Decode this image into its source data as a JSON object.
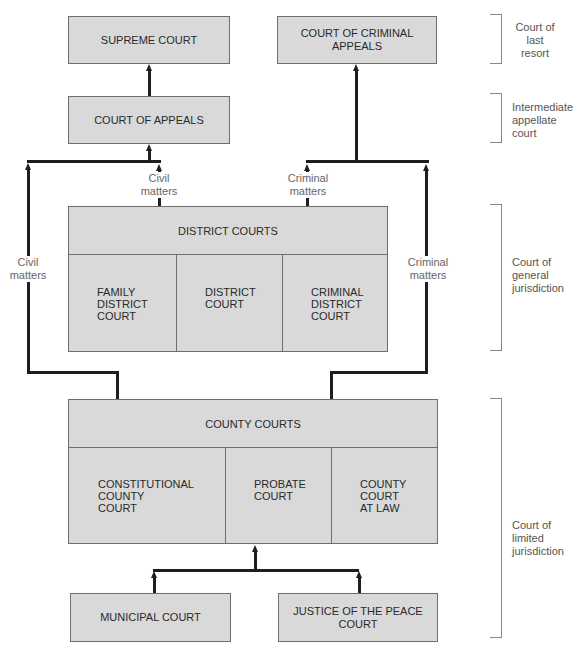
{
  "diagram": {
    "courts": {
      "supreme_court": "SUPREME COURT",
      "court_of_criminal_appeals": [
        "COURT OF CRIMINAL",
        "APPEALS"
      ],
      "court_of_appeals": "COURT OF APPEALS",
      "district_courts": {
        "header": "DISTRICT COURTS",
        "cells": [
          [
            "FAMILY",
            "DISTRICT",
            "COURT"
          ],
          [
            "DISTRICT",
            "COURT"
          ],
          [
            "CRIMINAL",
            "DISTRICT",
            "COURT"
          ]
        ]
      },
      "county_courts": {
        "header": "COUNTY COURTS",
        "cells": [
          [
            "CONSTITUTIONAL",
            "COUNTY",
            "COURT"
          ],
          [
            "PROBATE",
            "COURT"
          ],
          [
            "COUNTY",
            "COURT",
            "AT LAW"
          ]
        ]
      },
      "municipal_court": "MUNICIPAL COURT",
      "justice_of_the_peace_court": [
        "JUSTICE OF THE PEACE",
        "COURT"
      ]
    },
    "flow_labels": {
      "civil_left": [
        "Civil",
        "matters"
      ],
      "civil_center": [
        "Civil",
        "matters"
      ],
      "criminal_center": [
        "Criminal",
        "matters"
      ],
      "criminal_right": [
        "Criminal",
        "matters"
      ]
    },
    "tiers": [
      {
        "label": [
          "Court of",
          "last",
          "resort"
        ]
      },
      {
        "label": [
          "Intermediate",
          "appellate",
          "court"
        ]
      },
      {
        "label": [
          "Court of",
          "general",
          "jurisdiction"
        ]
      },
      {
        "label": [
          "Court of",
          "limited",
          "jurisdiction"
        ]
      }
    ],
    "colors": {
      "box_fill": "#d9d9d9",
      "box_border": "#6e6e6e",
      "connector": "#1e1e1e",
      "label_text": "#666666"
    }
  }
}
